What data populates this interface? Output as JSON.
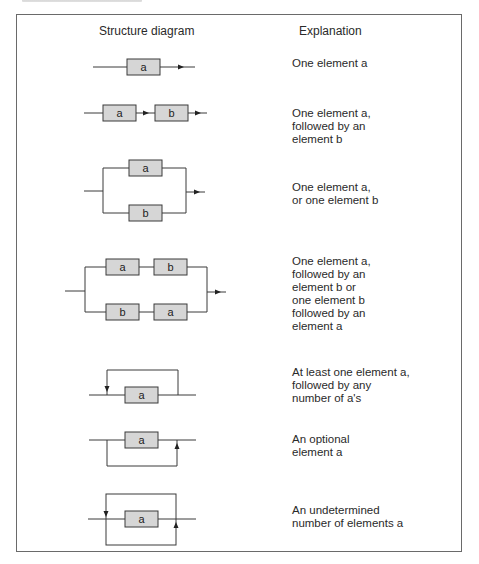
{
  "table": {
    "headers": {
      "diagram": "Structure diagram",
      "explanation": "Explanation"
    },
    "rows": [
      {
        "id": "sequence-single",
        "elements": [
          "a"
        ],
        "explanation": "One element a"
      },
      {
        "id": "sequence-pair",
        "elements": [
          "a",
          "b"
        ],
        "explanation": "One element a,\nfollowed by an\nelement b"
      },
      {
        "id": "selection",
        "elements": [
          "a",
          "b"
        ],
        "explanation": "One element a,\nor one element b"
      },
      {
        "id": "selection-of-sequences",
        "elements": [
          "a",
          "b",
          "b",
          "a"
        ],
        "explanation": "One element a,\nfollowed by an\nelement b or\none element b\nfollowed by an\nelement a"
      },
      {
        "id": "repetition-one-or-more",
        "elements": [
          "a"
        ],
        "explanation": "At least one element a,\nfollowed by any\nnumber of a's"
      },
      {
        "id": "optional",
        "elements": [
          "a"
        ],
        "explanation": "An optional\nelement a"
      },
      {
        "id": "repetition-zero-or-more",
        "elements": [
          "a"
        ],
        "explanation": "An undetermined\nnumber of elements a"
      }
    ]
  },
  "colors": {
    "box_fill": "#d6d6d6",
    "line": "#3a3a3a",
    "frame": "#6a6a6a",
    "text": "#2a2a2a"
  }
}
